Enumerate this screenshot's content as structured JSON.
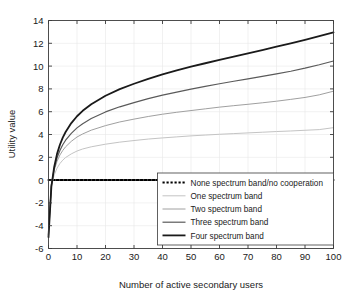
{
  "chart_data": {
    "type": "line",
    "title": "",
    "xlabel": "Number of active secondary users",
    "ylabel": "Utility value",
    "xlim": [
      0,
      100
    ],
    "ylim": [
      -6,
      14
    ],
    "xticks": [
      0,
      10,
      20,
      30,
      40,
      50,
      60,
      70,
      80,
      90,
      100
    ],
    "yticks": [
      -6,
      -4,
      -2,
      0,
      2,
      4,
      6,
      8,
      10,
      12,
      14
    ],
    "grid": true,
    "legend_position": "lower right",
    "x": [
      0,
      1,
      2,
      3,
      4,
      5,
      6,
      8,
      10,
      12,
      15,
      20,
      25,
      30,
      35,
      40,
      45,
      50,
      55,
      60,
      65,
      70,
      75,
      80,
      85,
      90,
      95,
      100
    ],
    "series": [
      {
        "name": "None spectrum band/no cooperation",
        "color": "#000000",
        "style": "dotted",
        "width": 2.0,
        "values": [
          0,
          0,
          0,
          0,
          0,
          0,
          0,
          0,
          0,
          0,
          0,
          0,
          0,
          0,
          0,
          0,
          0,
          0,
          0,
          0,
          0,
          0,
          0,
          0,
          0,
          0,
          0,
          0
        ]
      },
      {
        "name": "One spectrum band",
        "color": "#c4c4c4",
        "style": "solid",
        "width": 1.0,
        "values": [
          -4.3,
          -0.55,
          0.45,
          1.05,
          1.45,
          1.75,
          1.98,
          2.3,
          2.55,
          2.73,
          2.92,
          3.15,
          3.33,
          3.47,
          3.6,
          3.7,
          3.79,
          3.88,
          3.95,
          4.02,
          4.08,
          4.14,
          4.2,
          4.26,
          4.31,
          4.37,
          4.43,
          4.6
        ]
      },
      {
        "name": "Two spectrum band",
        "color": "#a0a0a0",
        "style": "solid",
        "width": 1.0,
        "values": [
          -4.5,
          -0.4,
          0.85,
          1.65,
          2.2,
          2.6,
          2.92,
          3.4,
          3.78,
          4.05,
          4.38,
          4.78,
          5.1,
          5.35,
          5.58,
          5.78,
          5.95,
          6.1,
          6.25,
          6.4,
          6.53,
          6.65,
          6.78,
          6.92,
          7.08,
          7.25,
          7.48,
          7.8
        ]
      },
      {
        "name": "Three spectrum band",
        "color": "#5a5a5a",
        "style": "solid",
        "width": 1.2,
        "values": [
          -4.8,
          -0.45,
          1.0,
          1.95,
          2.6,
          3.1,
          3.5,
          4.1,
          4.58,
          4.95,
          5.4,
          5.98,
          6.43,
          6.8,
          7.15,
          7.45,
          7.72,
          7.98,
          8.22,
          8.45,
          8.67,
          8.88,
          9.1,
          9.32,
          9.55,
          9.82,
          10.12,
          10.45
        ]
      },
      {
        "name": "Four spectrum band",
        "color": "#1a1a1a",
        "style": "solid",
        "width": 1.8,
        "values": [
          -5.0,
          -0.6,
          1.15,
          2.3,
          3.1,
          3.72,
          4.22,
          5.0,
          5.6,
          6.08,
          6.65,
          7.4,
          7.98,
          8.45,
          8.88,
          9.27,
          9.62,
          9.95,
          10.25,
          10.55,
          10.84,
          11.12,
          11.4,
          11.7,
          12.0,
          12.3,
          12.62,
          12.95
        ]
      }
    ]
  },
  "legend": {
    "items": [
      {
        "label": "None spectrum band/no cooperation"
      },
      {
        "label": "One spectrum band"
      },
      {
        "label": "Two spectrum band"
      },
      {
        "label": "Three spectrum band"
      },
      {
        "label": "Four spectrum band"
      }
    ]
  }
}
